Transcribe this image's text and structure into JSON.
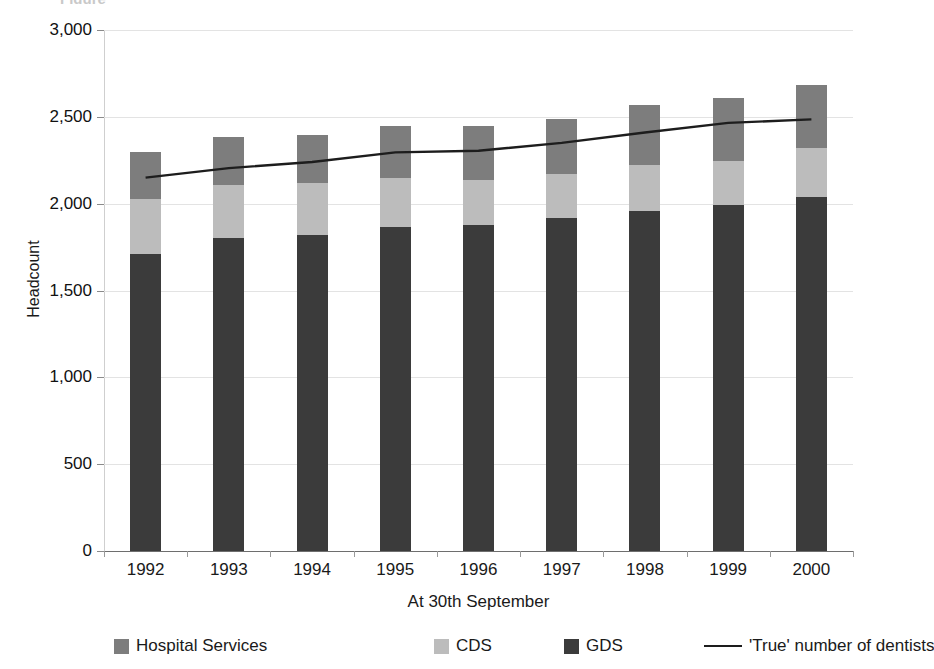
{
  "chart_data": {
    "type": "bar",
    "subtype": "stacked-bar-with-line-overlay",
    "title": "",
    "title_sliver": "Figure",
    "xlabel": "At 30th September",
    "ylabel": "Headcount",
    "categories": [
      "1992",
      "1993",
      "1994",
      "1995",
      "1996",
      "1997",
      "1998",
      "1999",
      "2000"
    ],
    "ylim": [
      0,
      3000
    ],
    "ytick_labels": [
      "3,000",
      "2,500",
      "2,000",
      "1,500",
      "1,000",
      "500",
      "0"
    ],
    "ytick_values": [
      3000,
      2500,
      2000,
      1500,
      1000,
      500,
      0
    ],
    "grid": true,
    "legend_position": "bottom",
    "series": [
      {
        "name": "GDS",
        "kind": "bar-segment",
        "color": "#3b3b3b",
        "values": [
          1710,
          1805,
          1820,
          1865,
          1875,
          1915,
          1955,
          1995,
          2040
        ]
      },
      {
        "name": "CDS",
        "kind": "bar-segment",
        "color": "#bcbcbc",
        "values": [
          315,
          305,
          300,
          285,
          260,
          255,
          265,
          250,
          280
        ]
      },
      {
        "name": "Hospital Services",
        "kind": "bar-segment",
        "color": "#7d7d7d",
        "values": [
          270,
          275,
          275,
          295,
          310,
          320,
          350,
          365,
          365
        ]
      },
      {
        "name": "'True' number of dentists",
        "kind": "line",
        "color": "#1d1d1d",
        "values": [
          2150,
          2205,
          2240,
          2295,
          2305,
          2350,
          2410,
          2465,
          2485
        ]
      }
    ],
    "totals": [
      2295,
      2385,
      2395,
      2445,
      2445,
      2490,
      2570,
      2610,
      2685
    ]
  },
  "legend": {
    "items": [
      {
        "label": "Hospital Services",
        "marker": "square",
        "color": "#7d7d7d"
      },
      {
        "label": "CDS",
        "marker": "square",
        "color": "#bcbcbc"
      },
      {
        "label": "GDS",
        "marker": "square",
        "color": "#3b3b3b"
      },
      {
        "label": "'True' number of dentists",
        "marker": "line",
        "color": "#1d1d1d"
      }
    ]
  }
}
